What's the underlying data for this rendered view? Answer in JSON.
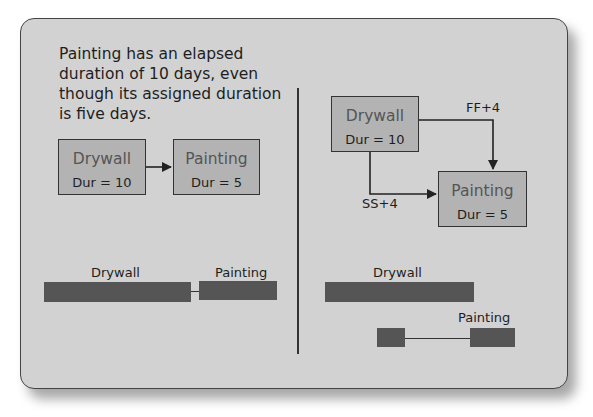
{
  "caption": "Painting has an elapsed duration of 10 days, even though its assigned duration is five days.",
  "left_diagram": {
    "nodes": [
      {
        "name": "Drywall",
        "duration": "Dur = 10"
      },
      {
        "name": "Painting",
        "duration": "Dur = 5"
      }
    ],
    "gantt": {
      "bar1_label": "Drywall",
      "bar2_label": "Painting"
    }
  },
  "right_diagram": {
    "nodes": [
      {
        "name": "Drywall",
        "duration": "Dur = 10"
      },
      {
        "name": "Painting",
        "duration": "Dur = 5"
      }
    ],
    "links": {
      "ff": "FF+4",
      "ss": "SS+4"
    },
    "gantt": {
      "bar1_label": "Drywall",
      "bar2_label": "Painting"
    }
  },
  "colors": {
    "panel": "#d2d2d2",
    "node": "#b3b3b3",
    "bar": "#555555"
  }
}
